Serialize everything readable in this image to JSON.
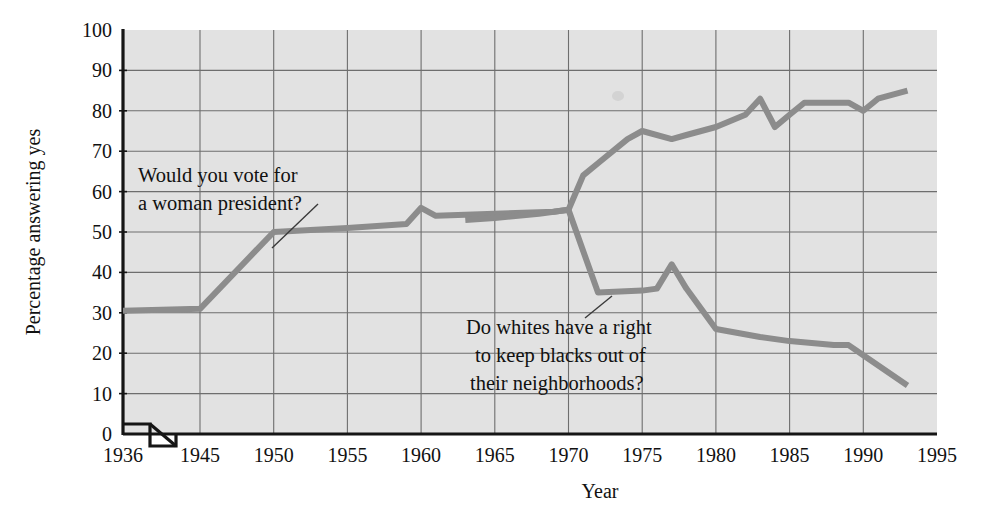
{
  "chart_data": {
    "type": "line",
    "title": "",
    "xlabel": "Year",
    "ylabel": "Percentage answering yes",
    "xlim": [
      1936,
      1995
    ],
    "ylim": [
      0,
      100
    ],
    "grid": true,
    "legend": "none (inline annotations with leader lines)",
    "axis_break": "x-axis broken between 1936 and 1945",
    "xticks": [
      "1936",
      "1945",
      "1950",
      "1955",
      "1960",
      "1965",
      "1970",
      "1975",
      "1980",
      "1985",
      "1990",
      "1995"
    ],
    "yticks": [
      "0",
      "10",
      "20",
      "30",
      "40",
      "50",
      "60",
      "70",
      "80",
      "90",
      "100"
    ],
    "series": [
      {
        "name": "Would you vote for a woman president?",
        "color": "#8c8c8c",
        "x": [
          1936,
          1945,
          1950,
          1955,
          1959,
          1960,
          1961,
          1965,
          1969,
          1970,
          1971,
          1972,
          1974,
          1975,
          1977,
          1978,
          1980,
          1982,
          1983,
          1984,
          1985,
          1986,
          1988,
          1989,
          1990,
          1991,
          1993
        ],
        "y": [
          30.5,
          31,
          50,
          51,
          52,
          56,
          54,
          54.5,
          55,
          55.5,
          64,
          67,
          73,
          75,
          73,
          74,
          76,
          79,
          83,
          76,
          79,
          82,
          82,
          82,
          80,
          83,
          85
        ]
      },
      {
        "name": "Do whites have a right to keep blacks out of their neighborhoods?",
        "color": "#8c8c8c",
        "x": [
          1963,
          1965,
          1968,
          1970,
          1972,
          1975,
          1976,
          1977,
          1978,
          1980,
          1983,
          1985,
          1988,
          1989,
          1990,
          1993
        ],
        "y": [
          53,
          53.5,
          54.5,
          55.5,
          35,
          35.5,
          36,
          42,
          36,
          26,
          24,
          23,
          22,
          22,
          19.5,
          12
        ]
      }
    ],
    "annotations": [
      {
        "id": "annotation-woman-president",
        "lines": [
          "Would you vote for",
          "a woman president?"
        ],
        "points_to_series": "Would you vote for a woman president?"
      },
      {
        "id": "annotation-neighborhoods",
        "lines": [
          "Do whites have a right",
          "to keep blacks out of",
          "their neighborhoods?"
        ],
        "points_to_series": "Do whites have a right to keep blacks out of their neighborhoods?"
      }
    ]
  },
  "colors": {
    "plot_background": "#e2e2e2",
    "grid": "#6e6e6e",
    "axis": "#151515",
    "line": "#8c8c8c",
    "text": "#151515"
  }
}
